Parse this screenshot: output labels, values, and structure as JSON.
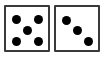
{
  "scene": {
    "title": "Two dice",
    "background_color": "#ffffff",
    "width": 104,
    "height": 57
  },
  "style": {
    "pip_color": "#000000",
    "die_face_color": "#ffffff",
    "die_border_color": "#3a3a3a",
    "die_border_width": 2,
    "die_corner_radius": 1,
    "pip_diameter": 9
  },
  "dice": [
    {
      "name": "left-die",
      "value": "5",
      "pattern": "quincunx",
      "x": 4,
      "y": 5,
      "width": 46,
      "height": 47,
      "pips": [
        {
          "name": "pip-top-left",
          "cx": 16,
          "cy": 19
        },
        {
          "name": "pip-top-right",
          "cx": 38,
          "cy": 19
        },
        {
          "name": "pip-center",
          "cx": 27,
          "cy": 30
        },
        {
          "name": "pip-bottom-left",
          "cx": 16,
          "cy": 41
        },
        {
          "name": "pip-bottom-right",
          "cx": 38,
          "cy": 41
        }
      ]
    },
    {
      "name": "right-die",
      "value": "3",
      "pattern": "diagonal",
      "x": 54,
      "y": 5,
      "width": 46,
      "height": 47,
      "pips": [
        {
          "name": "pip-top-left",
          "cx": 66,
          "cy": 20
        },
        {
          "name": "pip-center",
          "cx": 77,
          "cy": 30
        },
        {
          "name": "pip-bottom-right",
          "cx": 88,
          "cy": 41
        }
      ]
    }
  ],
  "summary": {
    "dice_count": "2",
    "total": "8",
    "caption": "5 and 3"
  }
}
